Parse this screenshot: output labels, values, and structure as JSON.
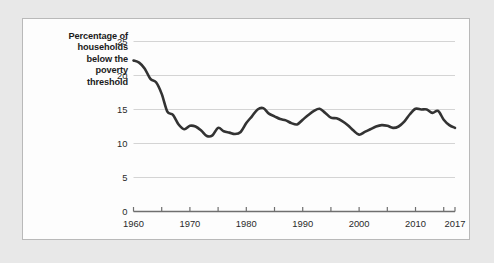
{
  "panel": {
    "background_color": "#fdfdfd",
    "border_color": "#b9b9b9",
    "outer_background_color": "#e8e8e8"
  },
  "chart_data": {
    "type": "line",
    "title": "",
    "subtitle": "",
    "xlabel": "",
    "ylabel": "Percentage of households below the poverty threshold",
    "ylabel_lines": [
      "Percentage of",
      "households",
      "below the",
      "poverty",
      "threshold"
    ],
    "xlim": [
      1960,
      2017
    ],
    "ylim": [
      0,
      25
    ],
    "ytick_labels": [
      "0",
      "5",
      "10",
      "15",
      "20",
      "25"
    ],
    "ytick_values": [
      0,
      5,
      10,
      15,
      20,
      25
    ],
    "xtick_labels": [
      "1960",
      "1970",
      "1980",
      "1990",
      "2000",
      "2010",
      "2017"
    ],
    "xtick_values": [
      1960,
      1970,
      1980,
      1990,
      2000,
      2010,
      2017
    ],
    "xminor_tick_values": [
      1960,
      1965,
      1970,
      1975,
      1980,
      1985,
      1990,
      1995,
      2000,
      2005,
      2010,
      2015
    ],
    "grid": "horizontal",
    "grid_color": "#d4d4d4",
    "legend": "none",
    "line_color": "#333333",
    "line_width": 2.6,
    "x": [
      1960,
      1961,
      1962,
      1963,
      1964,
      1965,
      1966,
      1967,
      1968,
      1969,
      1970,
      1971,
      1972,
      1973,
      1974,
      1975,
      1976,
      1977,
      1978,
      1979,
      1980,
      1981,
      1982,
      1983,
      1984,
      1985,
      1986,
      1987,
      1988,
      1989,
      1990,
      1991,
      1992,
      1993,
      1994,
      1995,
      1996,
      1997,
      1998,
      1999,
      2000,
      2001,
      2002,
      2003,
      2004,
      2005,
      2006,
      2007,
      2008,
      2009,
      2010,
      2011,
      2012,
      2013,
      2014,
      2015,
      2016,
      2017
    ],
    "values": [
      22.2,
      21.9,
      21.0,
      19.5,
      19.0,
      17.3,
      14.7,
      14.2,
      12.8,
      12.1,
      12.6,
      12.5,
      11.9,
      11.1,
      11.2,
      12.3,
      11.8,
      11.6,
      11.4,
      11.7,
      13.0,
      14.0,
      15.0,
      15.2,
      14.4,
      14.0,
      13.6,
      13.4,
      13.0,
      12.8,
      13.5,
      14.2,
      14.8,
      15.1,
      14.5,
      13.8,
      13.7,
      13.3,
      12.7,
      11.9,
      11.3,
      11.7,
      12.1,
      12.5,
      12.7,
      12.6,
      12.3,
      12.5,
      13.2,
      14.3,
      15.1,
      15.0,
      15.0,
      14.5,
      14.8,
      13.5,
      12.7,
      12.3
    ],
    "source_note": ""
  }
}
